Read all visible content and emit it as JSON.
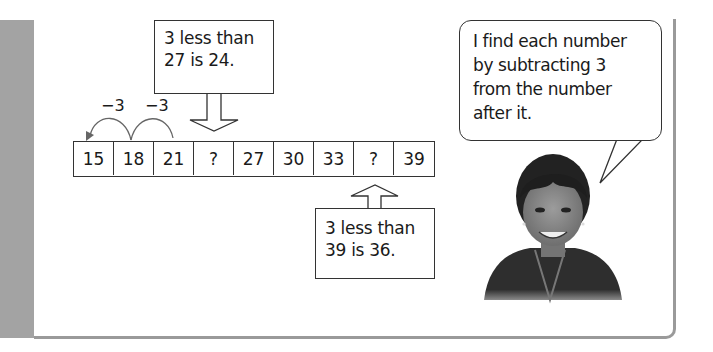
{
  "top_callout": {
    "line1": "3 less than",
    "line2": "27 is 24."
  },
  "bottom_callout": {
    "line1": "3 less than",
    "line2": "39 is 36."
  },
  "number_line": {
    "cells": [
      "15",
      "18",
      "21",
      "?",
      "27",
      "30",
      "33",
      "?",
      "39"
    ]
  },
  "jumps": [
    {
      "label": "−3",
      "from": "18",
      "to": "15"
    },
    {
      "label": "−3",
      "from": "21",
      "to": "18"
    }
  ],
  "speech_bubble": {
    "lines": [
      "I find each number",
      "by subtracting 3",
      "from the number",
      "after it."
    ]
  },
  "illustration": {
    "subject": "smiling-girl-photo"
  },
  "colors": {
    "sidebar": "#a3a3a3",
    "border": "#9a9a9a",
    "ink": "#1a1a1a"
  }
}
